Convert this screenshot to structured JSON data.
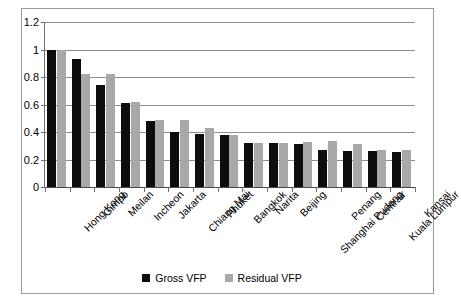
{
  "chart_data": {
    "type": "bar",
    "title": "",
    "xlabel": "",
    "ylabel": "",
    "ylim": [
      0,
      1.2
    ],
    "yticks": [
      "0",
      "0.2",
      "0.4",
      "0.6",
      "0.8",
      "1",
      "1.2"
    ],
    "ytick_values": [
      0,
      0.2,
      0.4,
      0.6,
      0.8,
      1.0,
      1.2
    ],
    "grid": "horizontal",
    "legend_position": "bottom-center",
    "categories": [
      "Hong Kong",
      "Gimpo",
      "Meilan",
      "Incheon",
      "Jakarta",
      "Chiang Mai",
      "Phuket",
      "Bangkok",
      "Narita",
      "Beijing",
      "Shanghai Pudong",
      "Penang",
      "Centrair",
      "Kuala Lumpur",
      "Kansai"
    ],
    "series": [
      {
        "name": "Gross VFP",
        "color": "#0d0d0d",
        "values": [
          1.0,
          0.93,
          0.74,
          0.61,
          0.48,
          0.4,
          0.385,
          0.375,
          0.32,
          0.32,
          0.315,
          0.27,
          0.265,
          0.26,
          0.255
        ]
      },
      {
        "name": "Residual VFP",
        "color": "#a8a8a8",
        "values": [
          1.0,
          0.82,
          0.82,
          0.62,
          0.49,
          0.49,
          0.43,
          0.375,
          0.32,
          0.32,
          0.33,
          0.335,
          0.31,
          0.27,
          0.27
        ]
      }
    ]
  },
  "legend": {
    "items": [
      {
        "label": "Gross VFP",
        "color": "#0d0d0d"
      },
      {
        "label": "Residual VFP",
        "color": "#a8a8a8"
      }
    ]
  }
}
